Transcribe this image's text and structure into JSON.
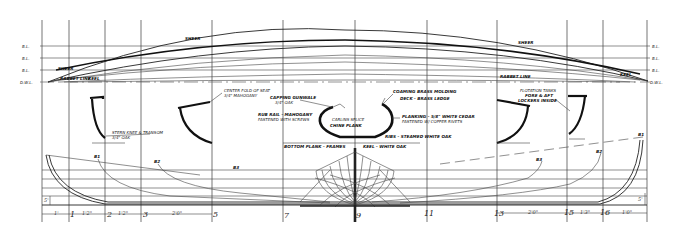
{
  "drawing": {
    "type": "boat-lines-plan",
    "stations": [
      "1",
      "2",
      "3",
      "5",
      "7",
      "9",
      "11",
      "13",
      "15",
      "16"
    ],
    "dimensions": [
      "1'",
      "1'2\"",
      "1'2\"",
      "2'0\"",
      "2'0\"",
      "1'3\"",
      "1'0\""
    ],
    "height_dim": "5'",
    "sheer_plan": {
      "left_level_labels": [
        "B.L.",
        "B.L.",
        "B.L.",
        "D.W.L."
      ],
      "right_level_labels": [
        "B.L.",
        "B.L.",
        "B.L.",
        "D.W.L."
      ],
      "line_labels": [
        "SHEER",
        "SHEER",
        "SHEER",
        "RABBET LINE",
        "KEEL",
        "KEEL"
      ]
    },
    "section_notes": {
      "left_section": "STERN KNEE & TRANSOM",
      "left_note_sub": "3/4\" OAK",
      "center_top_left": "CENTER FOLD OF SEAT",
      "center_top_left_sub": "3/4\" MAHOGANY",
      "gunwale_note": "CAPPING GUNWALE",
      "gunwale_sub": "3/4\" OAK",
      "rail_note": "RUB RAIL - MAHOGANY",
      "rail_sub": "FASTENED WITH SCREWS",
      "center_note": "CARLINS SPLICE",
      "center_note2": "CHINE PLANK",
      "center_right_top": "COAMING BRASS MOLDING",
      "center_right_top2": "DECK - BRASS LEDGE",
      "planking_note": "PLANKING - 5/8\" WHITE CEDAR",
      "planking_sub": "FASTENED W/ COPPER RIVETS",
      "keel_note": "KEEL - WHITE OAK",
      "keelson_note": "BOTTOM PLANK - FRAMES",
      "floor_note": "RIBS - STEAMED WHITE OAK",
      "right_note": "FLOTATION TANKS",
      "right_note_sub": "FORE & AFT",
      "right_note_sub2": "LOCKERS INSIDE"
    },
    "waterline_labels": [
      "B1",
      "B2",
      "B3",
      "B3",
      "B2",
      "B1"
    ]
  }
}
